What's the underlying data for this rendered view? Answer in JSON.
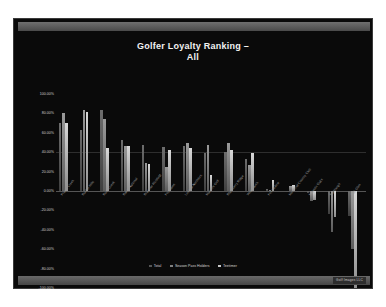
{
  "slide": {
    "watermark": "Golf Images LLC"
  },
  "chart_data": {
    "type": "bar",
    "title": "Golfer Loyalty Ranking –",
    "title_line2": "All",
    "xlabel": "",
    "ylabel": "",
    "ylim": [
      -100,
      100
    ],
    "grid": true,
    "legend_position": "bottom",
    "ytick_labels": [
      "100.00%",
      "80.00%",
      "60.00%",
      "40.00%",
      "20.00%",
      "0.00%",
      "-20.00%",
      "-40.00%",
      "-60.00%",
      "-80.00%",
      "-100.00%"
    ],
    "yticks": [
      100,
      80,
      60,
      40,
      20,
      0,
      -20,
      -40,
      -60,
      -80,
      -100
    ],
    "categories": [
      "Prairie Creek",
      "Bunker Hills",
      "Rush Creek",
      "Baker National",
      "Braemar Richfield",
      "Fountains",
      "Links at Northfork",
      "Mason's Golf",
      "Blackberry Ridge",
      "Wild Marsh",
      "Fox Hollow",
      "Memorial Country Club",
      "Majestic Oaks",
      "Edinburgh",
      "Oak Glen"
    ],
    "series": [
      {
        "name": "Total",
        "color": "#555555",
        "values": [
          70,
          63,
          83,
          53,
          47,
          45,
          46,
          39,
          40,
          33,
          2,
          -1,
          -2,
          -24,
          -26
        ]
      },
      {
        "name": "Season Pass Holders",
        "color": "#808080",
        "values": [
          80,
          84,
          74,
          46,
          29,
          25,
          49,
          47,
          50,
          27,
          1,
          5,
          -10,
          -42,
          -60
        ]
      },
      {
        "name": "Teetimer",
        "color": "#c8c8c8",
        "values": [
          70,
          81,
          44,
          46,
          28,
          42,
          44,
          17,
          42,
          39,
          11,
          6,
          -9,
          -27,
          -100
        ]
      }
    ]
  },
  "legend": {
    "items": [
      {
        "label": "Total",
        "color": "#555555"
      },
      {
        "label": "Season Pass Holders",
        "color": "#808080"
      },
      {
        "label": "Teetimer",
        "color": "#c8c8c8"
      }
    ]
  }
}
